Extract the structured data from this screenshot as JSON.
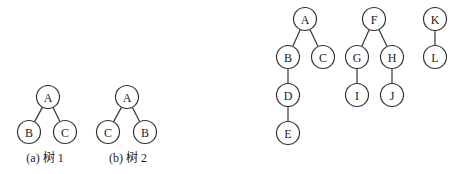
{
  "diagram": {
    "node_radius": 11.5,
    "stroke_color": "#333333",
    "trees": [
      {
        "id": "tree1",
        "caption": "(a) 树 1",
        "caption_pos": [
          45,
          158
        ],
        "nodes": [
          {
            "label": "A",
            "x": 48,
            "y": 97
          },
          {
            "label": "B",
            "x": 29,
            "y": 132
          },
          {
            "label": "C",
            "x": 65,
            "y": 132
          }
        ],
        "edges": [
          [
            "A",
            "B"
          ],
          [
            "A",
            "C"
          ]
        ]
      },
      {
        "id": "tree2",
        "caption": "(b) 树 2",
        "caption_pos": [
          128,
          158
        ],
        "nodes": [
          {
            "label": "A",
            "x": 127,
            "y": 97
          },
          {
            "label": "C",
            "x": 108,
            "y": 132
          },
          {
            "label": "B",
            "x": 145,
            "y": 132
          }
        ],
        "edges": [
          [
            "A",
            "C"
          ],
          [
            "A",
            "B"
          ]
        ]
      },
      {
        "id": "forest-tree-A",
        "caption": "",
        "nodes": [
          {
            "label": "A",
            "x": 305,
            "y": 19
          },
          {
            "label": "B",
            "x": 288,
            "y": 57
          },
          {
            "label": "C",
            "x": 323,
            "y": 57
          },
          {
            "label": "D",
            "x": 288,
            "y": 95
          },
          {
            "label": "E",
            "x": 288,
            "y": 133
          }
        ],
        "edges": [
          [
            "A",
            "B"
          ],
          [
            "A",
            "C"
          ],
          [
            "B",
            "D"
          ],
          [
            "D",
            "E"
          ]
        ]
      },
      {
        "id": "forest-tree-F",
        "caption": "",
        "nodes": [
          {
            "label": "F",
            "x": 374,
            "y": 19
          },
          {
            "label": "G",
            "x": 357,
            "y": 57
          },
          {
            "label": "H",
            "x": 392,
            "y": 57
          },
          {
            "label": "I",
            "x": 357,
            "y": 95
          },
          {
            "label": "J",
            "x": 392,
            "y": 95
          }
        ],
        "edges": [
          [
            "F",
            "G"
          ],
          [
            "F",
            "H"
          ],
          [
            "G",
            "I"
          ],
          [
            "H",
            "J"
          ]
        ]
      },
      {
        "id": "forest-tree-K",
        "caption": "",
        "nodes": [
          {
            "label": "K",
            "x": 435,
            "y": 19
          },
          {
            "label": "L",
            "x": 435,
            "y": 57
          }
        ],
        "edges": [
          [
            "K",
            "L"
          ]
        ]
      }
    ]
  }
}
